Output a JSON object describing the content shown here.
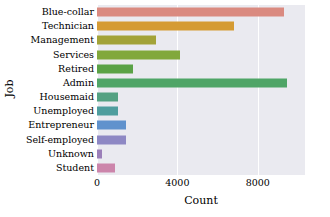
{
  "chart_data": {
    "type": "bar",
    "orientation": "horizontal",
    "title": "",
    "xlabel": "Count",
    "ylabel": "Job",
    "categories": [
      "Blue-collar",
      "Technician",
      "Management",
      "Services",
      "Retired",
      "Admin",
      "Housemaid",
      "Unemployed",
      "Entrepreneur",
      "Self-employed",
      "Unknown",
      "Student"
    ],
    "values": [
      9300,
      6800,
      2950,
      4150,
      1800,
      9450,
      1060,
      1060,
      1460,
      1420,
      270,
      880
    ],
    "colors": [
      "#da8a80",
      "#d59b33",
      "#a3a338",
      "#81a83c",
      "#5aa246",
      "#4fa567",
      "#54a182",
      "#4f9e9e",
      "#6092cd",
      "#8e88c4",
      "#9b7fb9",
      "#cc85ab"
    ],
    "xlim": [
      0,
      10350
    ],
    "ylim_categories": 12,
    "xticks": [
      0,
      4000,
      8000
    ],
    "xtick_labels": [
      "0",
      "4000",
      "8000"
    ],
    "grid": "vertical",
    "legend": "none",
    "plot_background": "#eaeaf0",
    "gridline_color": "#ffffff"
  }
}
